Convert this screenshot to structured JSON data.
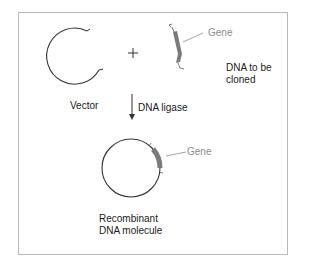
{
  "diagram": {
    "title": "",
    "labels": {
      "vector": "Vector",
      "plus": "+",
      "gene_top": "Gene",
      "dna_to_be_cloned_line1": "DNA to be",
      "dna_to_be_cloned_line2": "cloned",
      "dna_ligase": "DNA ligase",
      "gene_bottom": "Gene",
      "recombinant_line1": "Recombinant",
      "recombinant_line2": "DNA molecule"
    },
    "nodes": [
      {
        "id": "vector",
        "label": "Vector",
        "shape": "open circle"
      },
      {
        "id": "dna_fragment",
        "label": "DNA to be cloned",
        "shape": "gene fragment"
      },
      {
        "id": "recombinant",
        "label": "Recombinant DNA molecule",
        "shape": "closed circle with gene insert"
      }
    ],
    "edges": [
      {
        "from": "vector+dna_fragment",
        "to": "recombinant",
        "label": "DNA ligase"
      }
    ],
    "colors": {
      "line": "#333333",
      "gene_fill": "#7a7a7a",
      "gene_label": "#8c8c8c",
      "frame": "#b8b8b8"
    }
  }
}
